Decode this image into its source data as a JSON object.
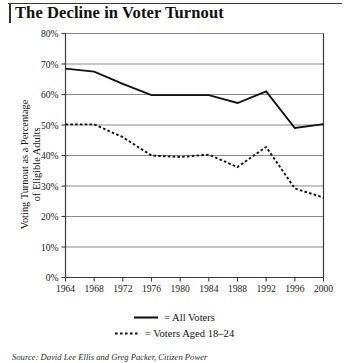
{
  "chart_title": "The Decline in Voter Turnout",
  "legend": {
    "position": "bottom-center",
    "items": [
      {
        "label": "= All Voters",
        "style": "solid",
        "swatch_name": "legend-swatch-solid"
      },
      {
        "label": "= Voters Aged 18–24",
        "style": "dashed",
        "swatch_name": "legend-swatch-dashed"
      }
    ]
  },
  "source_note": {
    "label": "Source:",
    "text": " David Lee Ellis and Greg Packer, Citizen Power"
  },
  "colors": {
    "line": "#111111",
    "grid": "#8a8a8a",
    "axis": "#3a3a3a",
    "background": "#ffffff"
  },
  "chart_data": {
    "type": "line",
    "title": "The Decline in Voter Turnout",
    "xlabel": "",
    "ylabel": "Voting Turnout as a Percentage\nof Eligible Adults",
    "x": [
      1964,
      1968,
      1972,
      1976,
      1980,
      1984,
      1988,
      1992,
      1996,
      2000
    ],
    "xtick_labels": [
      "1964",
      "1968",
      "1972",
      "1976",
      "1980",
      "1984",
      "1988",
      "1992",
      "1996",
      "2000"
    ],
    "ytick_labels": [
      "0%",
      "10%",
      "20%",
      "30%",
      "40%",
      "50%",
      "60%",
      "70%",
      "80%"
    ],
    "yticks": [
      0,
      10,
      20,
      30,
      40,
      50,
      60,
      70,
      80
    ],
    "ylim": [
      0,
      80
    ],
    "xlim": [
      1964,
      2000
    ],
    "grid": "horizontal",
    "series": [
      {
        "name": "All Voters",
        "style": "solid",
        "values": [
          68.5,
          67.5,
          63.5,
          59.8,
          59.8,
          59.8,
          57.2,
          61.0,
          49.0,
          50.3
        ]
      },
      {
        "name": "Voters Aged 18–24",
        "style": "dashed",
        "values": [
          50.2,
          50.2,
          46.0,
          40.0,
          39.5,
          40.3,
          36.2,
          42.8,
          29.2,
          26.2
        ]
      }
    ]
  }
}
